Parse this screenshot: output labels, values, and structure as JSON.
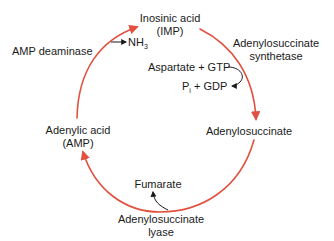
{
  "diagram": {
    "type": "cycle",
    "colors": {
      "cycle_arrow": "#e0523f",
      "text": "#1a1a1a",
      "side_arrow": "#1a1a1a",
      "background": "#ffffff"
    },
    "nodes": {
      "imp": {
        "line1": "Inosinic acid",
        "line2": "(IMP)"
      },
      "adenylosuccinate": {
        "label": "Adenylosuccinate"
      },
      "amp": {
        "line1": "Adenylic acid",
        "line2": "(AMP)"
      }
    },
    "enzymes": {
      "amp_deaminase": {
        "label": "AMP deaminase"
      },
      "synthetase": {
        "line1": "Adenylosuccinate",
        "line2": "synthetase"
      },
      "lyase": {
        "line1": "Adenylosuccinate",
        "line2": "lyase"
      }
    },
    "side_products": {
      "nh3": {
        "base": "NH",
        "sub": "3"
      },
      "inputs": {
        "label": "Aspartate + GTP"
      },
      "outputs": {
        "p": "P",
        "p_sub": "i",
        "rest": " + GDP"
      },
      "fumarate": {
        "label": "Fumarate"
      }
    },
    "edges": [
      {
        "from": "AMP",
        "to": "IMP",
        "enzyme": "AMP deaminase",
        "releases": "NH3"
      },
      {
        "from": "IMP",
        "to": "Adenylosuccinate",
        "enzyme": "Adenylosuccinate synthetase",
        "consumes": "Aspartate + GTP",
        "releases": "Pi + GDP"
      },
      {
        "from": "Adenylosuccinate",
        "to": "AMP",
        "enzyme": "Adenylosuccinate lyase",
        "releases": "Fumarate"
      }
    ]
  }
}
